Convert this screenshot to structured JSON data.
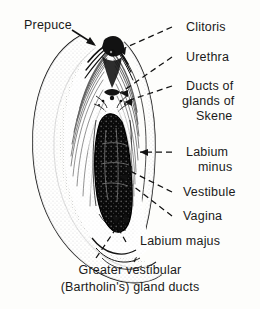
{
  "figure": {
    "type": "anatomical-illustration",
    "style": "black-and-white stippled line engraving",
    "background_color": "#fdfdfb",
    "ink_color": "#111111"
  },
  "labels": {
    "prepuce": "Prepuce",
    "clitoris": "Clitoris",
    "urethra": "Urethra",
    "ducts_line1": "Ducts of",
    "ducts_line2": "glands of",
    "ducts_line3": "Skene",
    "labium_minus_line1": "Labium",
    "labium_minus_line2": "minus",
    "vestibule": "Vestibule",
    "vagina": "Vagina",
    "labium_majus": "Labium majus",
    "bartholin_line1": "Greater vestibular",
    "bartholin_line2": "(Bartholin's) gland ducts"
  }
}
